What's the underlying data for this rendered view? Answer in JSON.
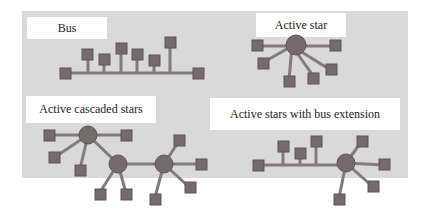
{
  "labels": {
    "bus": "Bus",
    "active_star": "Active star",
    "active_cascaded_stars": "Active cascaded stars",
    "active_stars_bus_extension": "Active stars with bus extension"
  },
  "colors": {
    "panel": "#d9d9d9",
    "node": "#766a6c",
    "line": "#857a7a",
    "hub": "#766a6c",
    "port": "#1a1a1a"
  }
}
